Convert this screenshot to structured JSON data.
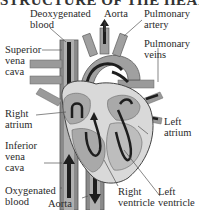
{
  "title": "STRUCTURE OF THE HEART",
  "labels": {
    "deoxygenated_blood": "Deoxygenated\nblood",
    "aorta_top": "Aorta",
    "pulmonary_artery": "Pulmonary\nartery",
    "pulmonary_veins": "Pulmonary\nveins",
    "superior_vena_cava": "Superior\nvena\ncava",
    "right_atrium": "Right\natrium",
    "left_atrium": "Left\natrium",
    "inferior_vena_cava": "Inferior\nvena\ncava",
    "oxygenated_blood": "Oxygenated\nblood",
    "aorta_bottom": "Aorta",
    "right_ventricle": "Right\nventricle",
    "left_ventricle": "Left\nventricle"
  },
  "colors": {
    "vessel": "#8a8a8a",
    "vessel_light": "#b8b8b8",
    "chamber": "#a9a9a9",
    "wall": "#d9d9d9",
    "arrow": "#1e1e1e",
    "leader": "#555555"
  }
}
